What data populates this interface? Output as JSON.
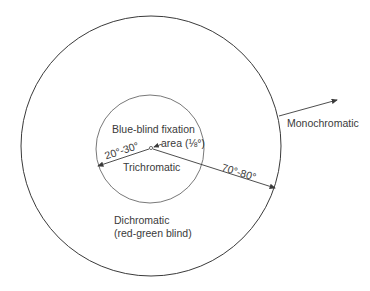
{
  "diagram": {
    "type": "concentric-zones",
    "colors": {
      "line": "#3a3a3a",
      "text": "#3a3a3a",
      "background": "#ffffff"
    },
    "zones": [
      {
        "name": "fixation",
        "label_line1": "Blue-blind fixation",
        "label_line2": "area (⅛°)"
      },
      {
        "name": "inner",
        "label": "Trichromatic",
        "radius_label": "20°-30°"
      },
      {
        "name": "middle",
        "label_line1": "Dichromatic",
        "label_line2": "(red-green blind)",
        "radius_label": "70°-80°"
      },
      {
        "name": "outer",
        "label": "Monochromatic"
      }
    ]
  }
}
